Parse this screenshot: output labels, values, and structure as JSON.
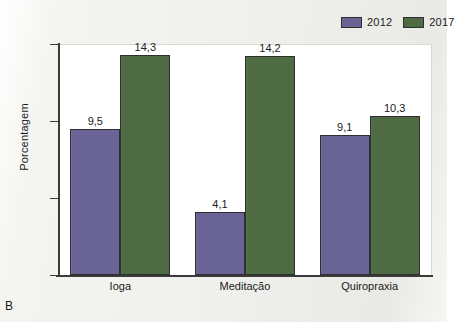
{
  "panel": {
    "letter": "B"
  },
  "legend": {
    "position": "top-right",
    "entries": [
      {
        "label": "2012",
        "color": "#6a6496",
        "icon": "legend-swatch-icon"
      },
      {
        "label": "2017",
        "color": "#4e6b44",
        "icon": "legend-swatch-icon"
      }
    ]
  },
  "axes": {
    "y_title": "Porcentagem",
    "y_ticks": [
      "0",
      "5",
      "10",
      "15"
    ]
  },
  "chart_data": {
    "type": "bar",
    "title": "",
    "subtitle": "",
    "xlabel": "",
    "ylabel": "Porcentagem",
    "ylim": [
      0,
      15
    ],
    "yticks": [
      0,
      5,
      10,
      15
    ],
    "ytick_labels": [
      "0",
      "5",
      "10",
      "15"
    ],
    "grid": false,
    "legend_position": "top-right",
    "decimal_separator": ",",
    "categories": [
      "Ioga",
      "Meditação",
      "Quiropraxia"
    ],
    "series": [
      {
        "name": "2012",
        "color": "#6a6496",
        "values": [
          9.5,
          4.1,
          9.1
        ],
        "labels": [
          "9,5",
          "4,1",
          "9,1"
        ]
      },
      {
        "name": "2017",
        "color": "#4e6b44",
        "values": [
          14.3,
          14.2,
          10.3
        ],
        "labels": [
          "14,3",
          "14,2",
          "10,3"
        ]
      }
    ]
  }
}
